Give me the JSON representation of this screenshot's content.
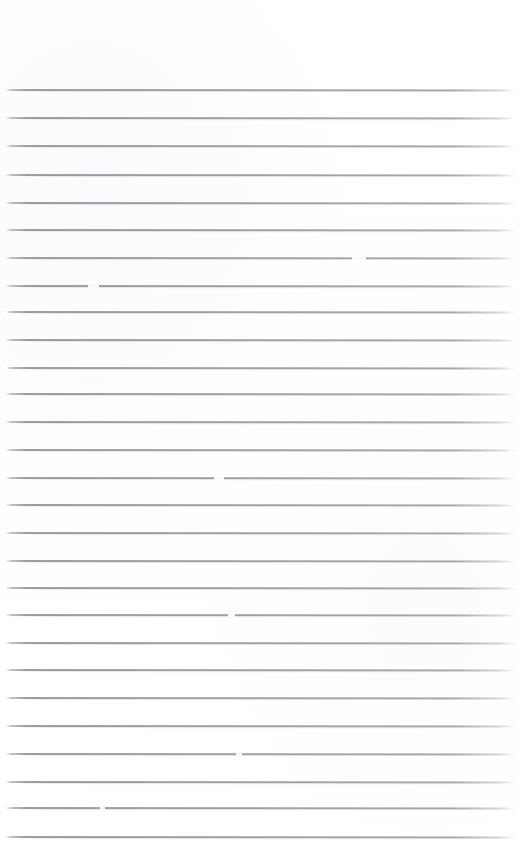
{
  "document": {
    "kind": "scanned-ruled-paper",
    "title": "Blank lined notebook page",
    "orientation": "portrait",
    "page_width_px": 519,
    "page_height_px": 866,
    "background_color": "#ffffff",
    "rule_color": "#9a9ba2",
    "rule_thickness_px": 1,
    "has_text": false,
    "has_margin_rule": false,
    "top_margin_px": 90,
    "bottom_margin_px": 29,
    "left_inset_px": 6,
    "right_inset_px": 5,
    "line_spacing_px": 27.7,
    "line_count": 28,
    "rules": [
      {
        "y": 90
      },
      {
        "y": 118
      },
      {
        "y": 146
      },
      {
        "y": 175
      },
      {
        "y": 203
      },
      {
        "y": 230
      },
      {
        "y": 258
      },
      {
        "y": 286
      },
      {
        "y": 312
      },
      {
        "y": 340
      },
      {
        "y": 368
      },
      {
        "y": 394
      },
      {
        "y": 422
      },
      {
        "y": 450
      },
      {
        "y": 478
      },
      {
        "y": 505
      },
      {
        "y": 533
      },
      {
        "y": 561
      },
      {
        "y": 588
      },
      {
        "y": 615
      },
      {
        "y": 643
      },
      {
        "y": 670
      },
      {
        "y": 698
      },
      {
        "y": 726
      },
      {
        "y": 754
      },
      {
        "y": 782
      },
      {
        "y": 808
      },
      {
        "y": 837
      }
    ],
    "dropouts": [
      {
        "y": 258,
        "x": 352,
        "w": 14
      },
      {
        "y": 286,
        "x": 88,
        "w": 8
      },
      {
        "y": 286,
        "x": 96,
        "w": 3
      },
      {
        "y": 478,
        "x": 214,
        "w": 10
      },
      {
        "y": 615,
        "x": 228,
        "w": 7
      },
      {
        "y": 754,
        "x": 236,
        "w": 6
      },
      {
        "y": 808,
        "x": 100,
        "w": 5
      }
    ]
  }
}
